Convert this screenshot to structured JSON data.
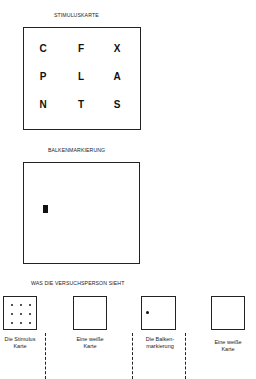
{
  "sections": {
    "stimulus": {
      "heading": "STIMULUSKARTE",
      "letters": [
        [
          "C",
          "F",
          "X"
        ],
        [
          "P",
          "L",
          "A"
        ],
        [
          "N",
          "T",
          "S"
        ]
      ]
    },
    "bar_marker": {
      "heading": "BALKENMARKIERUNG"
    },
    "subject_view": {
      "heading": "WAS DIE VERSUCHSPERSON SIEHT",
      "cards": [
        {
          "type": "stimulus",
          "caption": "Die Stimulus\nKarte"
        },
        {
          "type": "blank",
          "caption": "Eine weiße\nKarte"
        },
        {
          "type": "bar",
          "caption": "Die Balken-\nmarkierung"
        },
        {
          "type": "blank",
          "caption": "Eine weiße\nKarte"
        }
      ]
    }
  }
}
